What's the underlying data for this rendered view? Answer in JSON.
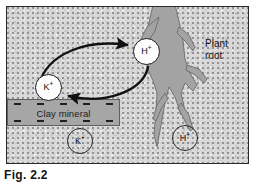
{
  "figure": {
    "caption": "Fig. 2.2",
    "background_color": "#d9d9d9",
    "frame_color": "#2b2b2b"
  },
  "diagram": {
    "root": {
      "label_line1": "Plant",
      "label_line2": "root",
      "fill_color": "#a3a3a3",
      "outline_color": "#5c5c5c"
    },
    "clay_mineral": {
      "label": "Clay mineral",
      "fill_color": "#a6a6a6",
      "outline_color": "#5e5e5e",
      "charge_symbol": "minus",
      "charges_top": 5,
      "charges_bottom": 5
    },
    "ions": [
      {
        "id": "k-exchange",
        "symbol": "K",
        "charge": "+",
        "style": "filled",
        "description": "potassium ion leaving clay surface"
      },
      {
        "id": "h-exchange",
        "symbol": "H",
        "charge": "+",
        "style": "filled",
        "description": "hydrogen ion released by root"
      },
      {
        "id": "k-soil",
        "symbol": "K",
        "charge": "+",
        "style": "outline",
        "description": "potassium ion in soil solution"
      },
      {
        "id": "h-soil",
        "symbol": "H",
        "charge": "+",
        "style": "outline",
        "description": "hydrogen ion in soil solution"
      }
    ],
    "arrows": [
      {
        "id": "arrow-k-to-root",
        "from": "k-exchange",
        "to": "h-exchange",
        "direction": "upper-curve-right",
        "color": "#111111"
      },
      {
        "id": "arrow-h-to-clay",
        "from": "h-exchange",
        "to": "k-exchange",
        "direction": "lower-curve-left",
        "color": "#111111"
      }
    ]
  }
}
